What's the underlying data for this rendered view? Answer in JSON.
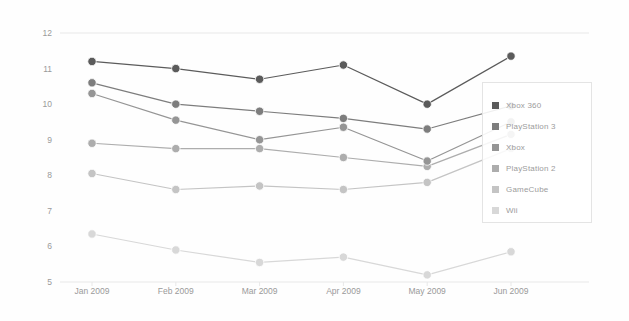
{
  "chart_data": {
    "type": "line",
    "title": "",
    "subtitle": "",
    "xlabel": "",
    "ylabel": "Active User %",
    "categories": [
      "Jan 2009",
      "Feb 2009",
      "Mar 2009",
      "Apr 2009",
      "May 2009",
      "Jun 2009"
    ],
    "ylim": [
      5,
      12
    ],
    "yticks": [
      5,
      6,
      7,
      8,
      9,
      10,
      11,
      12
    ],
    "grid": "horizontal-top-and-bottom-only",
    "legend_position": "right",
    "markers": "filled-circles",
    "series": [
      {
        "name": "Xbox 360",
        "color": "#5b5b5b",
        "values": [
          11.2,
          11.0,
          10.7,
          11.1,
          10.0,
          11.35
        ]
      },
      {
        "name": "PlayStation 3",
        "color": "#7d7d7d",
        "values": [
          10.6,
          10.0,
          9.8,
          9.6,
          9.3,
          9.95
        ]
      },
      {
        "name": "Xbox",
        "color": "#959595",
        "values": [
          10.3,
          9.55,
          9.0,
          9.35,
          8.4,
          9.5
        ]
      },
      {
        "name": "PlayStation 2",
        "color": "#adadad",
        "values": [
          8.9,
          8.75,
          8.75,
          8.5,
          8.25,
          9.15
        ]
      },
      {
        "name": "GameCube",
        "color": "#c4c4c4",
        "values": [
          8.05,
          7.6,
          7.7,
          7.6,
          7.8,
          8.75
        ]
      },
      {
        "name": "Wii",
        "color": "#d8d8d8",
        "values": [
          6.35,
          5.9,
          5.55,
          5.7,
          5.2,
          5.85
        ]
      }
    ]
  },
  "axis": {
    "y_title": "Active User %",
    "y_tick_labels": [
      "12",
      "11",
      "10",
      "9",
      "8",
      "7",
      "6",
      "5"
    ],
    "x_tick_labels": [
      "Jan 2009",
      "Feb 2009",
      "Mar 2009",
      "Apr 2009",
      "May 2009",
      "Jun 2009"
    ]
  },
  "legend": {
    "items": [
      {
        "label": "Xbox 360",
        "color": "#5b5b5b"
      },
      {
        "label": "PlayStation 3",
        "color": "#7d7d7d"
      },
      {
        "label": "Xbox",
        "color": "#959595"
      },
      {
        "label": "PlayStation 2",
        "color": "#adadad"
      },
      {
        "label": "GameCube",
        "color": "#c4c4c4"
      },
      {
        "label": "Wii",
        "color": "#d8d8d8"
      }
    ]
  },
  "colors": {
    "gridline": "#e8e8e8",
    "axis_text": "#9a9a9a",
    "legend_border": "#e4e4e4",
    "background": "#fefefe"
  }
}
